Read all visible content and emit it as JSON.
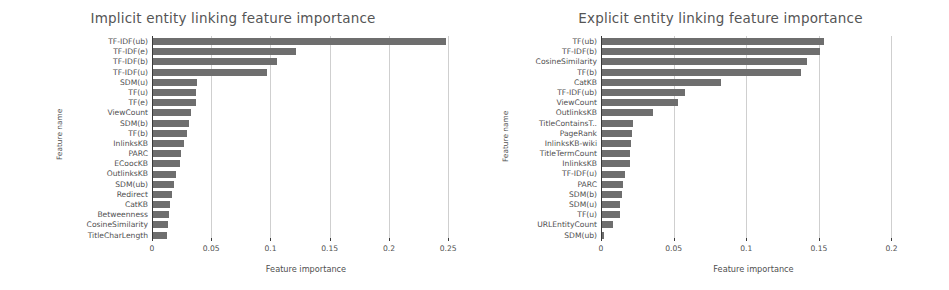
{
  "chart_data": [
    {
      "type": "bar",
      "orientation": "horizontal",
      "title": "Implicit entity linking feature importance",
      "xlabel": "Feature importance",
      "ylabel": "Feature name",
      "xlim": [
        0,
        0.26
      ],
      "xticks": [
        0,
        0.05,
        0.1,
        0.15,
        0.2,
        0.25
      ],
      "xtick_labels": [
        "0",
        "0.05",
        "0.1",
        "0.15",
        "0.2",
        "0.25"
      ],
      "grid": true,
      "bar_color": "#6e6e6e",
      "categories": [
        "TF-IDF(ub)",
        "TF-IDF(e)",
        "TF-IDF(b)",
        "TF-IDF(u)",
        "SDM(u)",
        "TF(u)",
        "TF(e)",
        "ViewCount",
        "SDM(b)",
        "TF(b)",
        "InlinksKB",
        "PARC",
        "ECoocKB",
        "OutlinksKB",
        "SDM(ub)",
        "Redirect",
        "CatKB",
        "Betweenness",
        "CosineSimilarity",
        "TitleCharLength"
      ],
      "values": [
        0.247,
        0.121,
        0.105,
        0.096,
        0.037,
        0.036,
        0.036,
        0.032,
        0.03,
        0.029,
        0.026,
        0.024,
        0.023,
        0.019,
        0.018,
        0.016,
        0.014,
        0.0135,
        0.013,
        0.012
      ]
    },
    {
      "type": "bar",
      "orientation": "horizontal",
      "title": "Explicit entity linking feature importance",
      "xlabel": "Feature importance",
      "ylabel": "Feature name",
      "xlim": [
        0,
        0.21
      ],
      "xticks": [
        0,
        0.05,
        0.1,
        0.15,
        0.2
      ],
      "xtick_labels": [
        "0",
        "0.05",
        "0.1",
        "0.15",
        "0.2"
      ],
      "grid": true,
      "bar_color": "#6e6e6e",
      "categories": [
        "TF(ub)",
        "TF-IDF(b)",
        "CosineSimilarity",
        "TF(b)",
        "CatKB",
        "TF-IDF(ub)",
        "ViewCount",
        "OutlinksKB",
        "TitleContainsT..",
        "PageRank",
        "InlinksKB-wiki",
        "TitleTermCount",
        "InlinksKB",
        "TF-IDF(u)",
        "PARC",
        "SDM(b)",
        "SDM(u)",
        "TF(u)",
        "URLEntityCount",
        "SDM(ub)"
      ],
      "values": [
        0.153,
        0.15,
        0.141,
        0.137,
        0.082,
        0.057,
        0.052,
        0.035,
        0.021,
        0.0205,
        0.02,
        0.0195,
        0.019,
        0.016,
        0.0145,
        0.014,
        0.0125,
        0.0123,
        0.0073,
        0.0016
      ]
    }
  ]
}
